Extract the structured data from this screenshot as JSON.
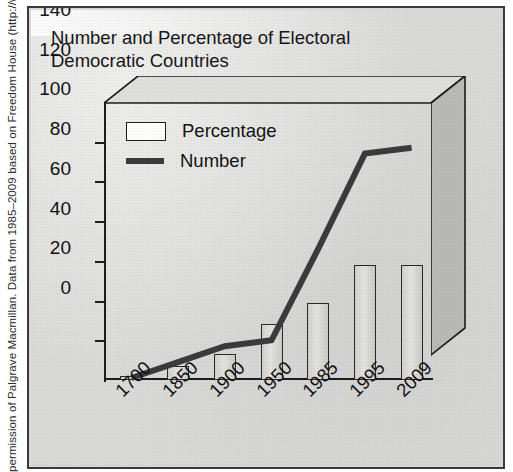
{
  "caption": {
    "text": "permission of Palgrave Macmillan. Data from 1985–2009 based on Freedom House (http://www.freedomhouse.org)."
  },
  "figure": {
    "title_line1": "Number and Percentage of Electoral",
    "title_line2": "Democratic Countries"
  },
  "legend": {
    "items": [
      {
        "label": "Percentage",
        "marker": "box-swatch",
        "color": "#fdfdfc"
      },
      {
        "label": "Number",
        "marker": "line-swatch",
        "color": "#3b3b3b"
      }
    ]
  },
  "axes": {
    "y_ticks": [
      "140",
      "120",
      "100",
      "80",
      "60",
      "40",
      "20",
      "0"
    ],
    "x_ticks": [
      "1700",
      "1850",
      "1900",
      "1950",
      "1985",
      "1995",
      "2009"
    ]
  },
  "chart_data": {
    "type": "bar",
    "title": "Number and Percentage of Electoral Democratic Countries",
    "xlabel": "",
    "ylabel": "",
    "ylim": [
      0,
      140
    ],
    "ytick_step": 20,
    "grid": false,
    "legend_position": "top-left-inside",
    "categories": [
      "1700",
      "1850",
      "1900",
      "1950",
      "1985",
      "1995",
      "2009"
    ],
    "series": [
      {
        "name": "Percentage",
        "type": "bar",
        "values": [
          2,
          7,
          13,
          28,
          39,
          58,
          58
        ],
        "color": "#dcdcd9",
        "edge_color": "#2a2a2a"
      },
      {
        "name": "Number",
        "type": "line",
        "values": [
          1,
          9,
          17,
          20,
          66,
          114,
          117
        ],
        "color": "#3b3b3b",
        "line_width": 6
      }
    ]
  },
  "colors": {
    "panel_background": "#d9d9d7",
    "frame": "#3a3a3a",
    "axis": "#1d1d1d",
    "bar_fill": "#dcdcd9",
    "line": "#3b3b3b",
    "depth_shade": "#b5b5b2"
  }
}
